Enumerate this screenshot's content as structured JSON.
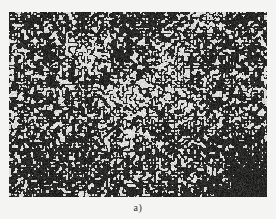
{
  "figure": {
    "label": "a)",
    "image": {
      "description": "metallographic micrograph with dense dark dendritic / labyrinth-like microstructure on light background",
      "colors": {
        "dark_phase": "#141414",
        "light_phase": "#e6e6e2",
        "background": "#f4f4f2"
      },
      "features": [
        "dark dense cluster bottom-right corner",
        "dark dense band lower-left",
        "lighter patches near upper-center and right edge"
      ]
    }
  }
}
